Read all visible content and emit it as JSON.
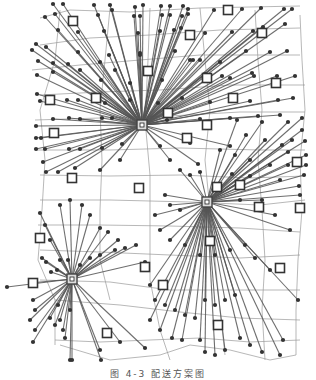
{
  "figure": {
    "width": 316,
    "height": 377,
    "colors": {
      "background": "#ffffff",
      "road": "#9a9a9a",
      "spoke": "#555555",
      "node": "#333333",
      "facility_stroke": "#333333",
      "hub_stroke": "#444444"
    },
    "hubs": [
      {
        "id": "H1",
        "x": 142,
        "y": 125
      },
      {
        "id": "H2",
        "x": 207,
        "y": 202
      },
      {
        "id": "H3",
        "x": 72,
        "y": 279
      }
    ],
    "facilities": [
      [
        73,
        21
      ],
      [
        228,
        10
      ],
      [
        190,
        35
      ],
      [
        262,
        33
      ],
      [
        148,
        71
      ],
      [
        50,
        100
      ],
      [
        96,
        98
      ],
      [
        207,
        78
      ],
      [
        276,
        83
      ],
      [
        233,
        98
      ],
      [
        168,
        113
      ],
      [
        54,
        133
      ],
      [
        187,
        138
      ],
      [
        207,
        125
      ],
      [
        72,
        178
      ],
      [
        139,
        188
      ],
      [
        217,
        187
      ],
      [
        240,
        185
      ],
      [
        259,
        207
      ],
      [
        297,
        162
      ],
      [
        300,
        208
      ],
      [
        210,
        241
      ],
      [
        40,
        238
      ],
      [
        145,
        267
      ],
      [
        280,
        268
      ],
      [
        163,
        285
      ],
      [
        33,
        283
      ],
      [
        218,
        325
      ],
      [
        107,
        333
      ]
    ],
    "demand_nodes": {
      "H1": [
        [
          53,
          4
        ],
        [
          63,
          4
        ],
        [
          94,
          5
        ],
        [
          110,
          5
        ],
        [
          135,
          7
        ],
        [
          143,
          5
        ],
        [
          161,
          6
        ],
        [
          170,
          6
        ],
        [
          183,
          6
        ],
        [
          188,
          9
        ],
        [
          214,
          10
        ],
        [
          242,
          9
        ],
        [
          261,
          8
        ],
        [
          284,
          9
        ],
        [
          292,
          9
        ],
        [
          45,
          17
        ],
        [
          55,
          14
        ],
        [
          98,
          15
        ],
        [
          112,
          10
        ],
        [
          134,
          16
        ],
        [
          140,
          16
        ],
        [
          162,
          15
        ],
        [
          170,
          15
        ],
        [
          182,
          16
        ],
        [
          188,
          14
        ],
        [
          58,
          30
        ],
        [
          78,
          32
        ],
        [
          104,
          31
        ],
        [
          138,
          33
        ],
        [
          160,
          31
        ],
        [
          174,
          30
        ],
        [
          181,
          28
        ],
        [
          205,
          33
        ],
        [
          232,
          32
        ],
        [
          253,
          31
        ],
        [
          263,
          27
        ],
        [
          285,
          24
        ],
        [
          36,
          44
        ],
        [
          46,
          47
        ],
        [
          78,
          52
        ],
        [
          109,
          55
        ],
        [
          140,
          55
        ],
        [
          175,
          51
        ],
        [
          193,
          60
        ],
        [
          220,
          62
        ],
        [
          246,
          51
        ],
        [
          270,
          52
        ],
        [
          287,
          51
        ],
        [
          32,
          50
        ],
        [
          38,
          61
        ],
        [
          53,
          63
        ],
        [
          68,
          64
        ],
        [
          100,
          62
        ],
        [
          115,
          70
        ],
        [
          140,
          53
        ],
        [
          190,
          60
        ],
        [
          200,
          60
        ],
        [
          222,
          76
        ],
        [
          254,
          76
        ],
        [
          277,
          76
        ],
        [
          37,
          75
        ],
        [
          53,
          72
        ],
        [
          80,
          70
        ],
        [
          101,
          80
        ],
        [
          130,
          83
        ],
        [
          162,
          80
        ],
        [
          205,
          74
        ],
        [
          230,
          78
        ],
        [
          252,
          73
        ],
        [
          295,
          76
        ],
        [
          37,
          94
        ],
        [
          40,
          101
        ],
        [
          67,
          100
        ],
        [
          78,
          100
        ],
        [
          105,
          103
        ],
        [
          130,
          100
        ],
        [
          158,
          103
        ],
        [
          182,
          98
        ],
        [
          210,
          102
        ],
        [
          250,
          101
        ],
        [
          278,
          100
        ],
        [
          293,
          98
        ],
        [
          36,
          126
        ],
        [
          53,
          119
        ],
        [
          69,
          118
        ],
        [
          80,
          119
        ],
        [
          102,
          118
        ],
        [
          112,
          118
        ],
        [
          167,
          120
        ],
        [
          200,
          119
        ],
        [
          230,
          118
        ],
        [
          258,
          116
        ],
        [
          280,
          115
        ],
        [
          36,
          138
        ],
        [
          41,
          138
        ],
        [
          36,
          149
        ],
        [
          45,
          149
        ],
        [
          69,
          149
        ],
        [
          80,
          149
        ],
        [
          102,
          148
        ],
        [
          122,
          144
        ],
        [
          160,
          146
        ],
        [
          190,
          143
        ],
        [
          230,
          146
        ],
        [
          43,
          162
        ],
        [
          46,
          172
        ],
        [
          58,
          172
        ],
        [
          75,
          168
        ],
        [
          100,
          170
        ],
        [
          120,
          160
        ],
        [
          170,
          160
        ],
        [
          198,
          164
        ]
      ],
      "H2": [
        [
          237,
          120
        ],
        [
          262,
          122
        ],
        [
          288,
          122
        ],
        [
          302,
          118
        ],
        [
          302,
          130
        ],
        [
          292,
          140
        ],
        [
          288,
          152
        ],
        [
          305,
          141
        ],
        [
          306,
          155
        ],
        [
          306,
          165
        ],
        [
          304,
          175
        ],
        [
          246,
          135
        ],
        [
          265,
          140
        ],
        [
          282,
          145
        ],
        [
          220,
          150
        ],
        [
          235,
          155
        ],
        [
          250,
          160
        ],
        [
          270,
          165
        ],
        [
          288,
          165
        ],
        [
          180,
          170
        ],
        [
          190,
          175
        ],
        [
          200,
          172
        ],
        [
          232,
          174
        ],
        [
          250,
          176
        ],
        [
          280,
          180
        ],
        [
          299,
          186
        ],
        [
          165,
          195
        ],
        [
          170,
          205
        ],
        [
          180,
          210
        ],
        [
          240,
          200
        ],
        [
          262,
          200
        ],
        [
          275,
          215
        ],
        [
          290,
          230
        ],
        [
          300,
          195
        ],
        [
          155,
          215
        ],
        [
          160,
          230
        ],
        [
          170,
          240
        ],
        [
          185,
          245
        ],
        [
          200,
          255
        ],
        [
          215,
          255
        ],
        [
          230,
          250
        ],
        [
          245,
          245
        ],
        [
          255,
          258
        ],
        [
          270,
          270
        ],
        [
          150,
          285
        ],
        [
          155,
          300
        ],
        [
          165,
          305
        ],
        [
          175,
          310
        ],
        [
          185,
          315
        ],
        [
          195,
          318
        ],
        [
          205,
          300
        ],
        [
          215,
          305
        ],
        [
          225,
          300
        ],
        [
          235,
          295
        ],
        [
          150,
          320
        ],
        [
          160,
          330
        ],
        [
          172,
          338
        ],
        [
          182,
          340
        ],
        [
          200,
          340
        ],
        [
          205,
          352
        ],
        [
          215,
          355
        ],
        [
          225,
          350
        ],
        [
          240,
          338
        ],
        [
          250,
          345
        ],
        [
          262,
          352
        ],
        [
          280,
          355
        ],
        [
          283,
          340
        ],
        [
          298,
          300
        ]
      ],
      "H3": [
        [
          7,
          287
        ],
        [
          30,
          283
        ],
        [
          57,
          270
        ],
        [
          80,
          265
        ],
        [
          90,
          258
        ],
        [
          100,
          255
        ],
        [
          115,
          250
        ],
        [
          125,
          248
        ],
        [
          136,
          245
        ],
        [
          145,
          262
        ],
        [
          40,
          213
        ],
        [
          45,
          225
        ],
        [
          50,
          240
        ],
        [
          60,
          205
        ],
        [
          70,
          200
        ],
        [
          82,
          205
        ],
        [
          90,
          215
        ],
        [
          100,
          228
        ],
        [
          108,
          232
        ],
        [
          118,
          240
        ],
        [
          42,
          258
        ],
        [
          46,
          262
        ],
        [
          51,
          272
        ],
        [
          60,
          260
        ],
        [
          68,
          260
        ],
        [
          33,
          300
        ],
        [
          35,
          310
        ],
        [
          30,
          320
        ],
        [
          35,
          330
        ],
        [
          33,
          342
        ],
        [
          50,
          318
        ],
        [
          55,
          325
        ],
        [
          60,
          320
        ],
        [
          63,
          330
        ],
        [
          65,
          338
        ],
        [
          58,
          305
        ],
        [
          70,
          310
        ],
        [
          70,
          360
        ],
        [
          72,
          360
        ],
        [
          100,
          350
        ],
        [
          101,
          360
        ],
        [
          120,
          342
        ],
        [
          145,
          348
        ]
      ]
    },
    "roads": [
      "40,18 70,10 130,12 200,8 300,6",
      "40,45 90,38 150,35 220,30 300,28",
      "32,70 80,65 140,60 200,55 300,55",
      "40,95 100,92 160,90 230,85 305,85",
      "35,120 100,118 170,116 240,112 305,112",
      "35,150 110,150 180,148 260,150 305,150",
      "40,175 110,176 180,175 250,178 305,176",
      "40,200 110,200 190,202 260,205 305,200",
      "38,225 100,225 170,226 240,228 300,232",
      "40,250 100,252 170,255 240,258 300,255",
      "40,280 110,282 170,290 240,290 300,290",
      "55,300 120,305 180,312 240,318 300,320",
      "55,340 100,342 150,340 200,338 250,342 300,340",
      "60,10 55,60 40,110 45,160 42,210 38,260 55,300 55,345",
      "110,8 105,60 100,110 102,160 100,210 100,260 110,300",
      "150,8 148,60 145,120 150,175 150,230 150,280 160,330 170,360",
      "200,8 205,60 210,110 205,160 210,210 215,260 220,310 225,355",
      "255,10 258,60 262,110 258,160 262,210 265,260 262,310 265,360",
      "300,15 302,60 305,110 300,160 302,210 298,260 296,310 296,355",
      "60,345 110,360 160,355 190,345 230,350 270,360 296,355"
    ]
  },
  "caption": {
    "text": "图 4-3  配送方案图"
  }
}
